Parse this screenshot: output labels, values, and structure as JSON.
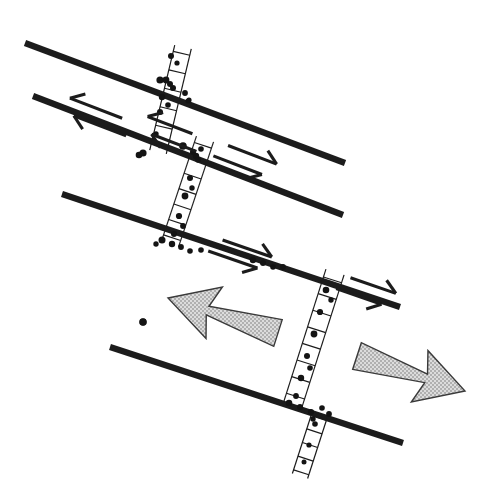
{
  "figure": {
    "domain_note": "structural geology line drawing",
    "canvas": {
      "width": 498,
      "height": 498,
      "background": "#ffffff"
    },
    "colors": {
      "line": "#1c1c1c",
      "clast": "#141414",
      "arrow_fill_light": "#d9d9d9",
      "arrow_outline": "#3a3a3a",
      "background": "#ffffff"
    }
  },
  "master_faults": [
    {
      "id": "fault-1",
      "label": "master fault 1",
      "x1": 25,
      "y1": 43,
      "x2": 345,
      "y2": 163,
      "stroke_width": 6.2
    },
    {
      "id": "fault-2",
      "label": "master fault 2",
      "x1": 33,
      "y1": 96,
      "x2": 343,
      "y2": 215,
      "stroke_width": 6.2
    },
    {
      "id": "fault-3",
      "label": "master fault 3",
      "x1": 62,
      "y1": 194,
      "x2": 400,
      "y2": 307,
      "stroke_width": 6.2
    },
    {
      "id": "fault-4",
      "label": "master fault 4",
      "x1": 110,
      "y1": 347,
      "x2": 403,
      "y2": 443,
      "stroke_width": 6.2
    }
  ],
  "dilational_bands": [
    {
      "id": "band-1",
      "label": "step-over band 1",
      "ax": 183,
      "ay": 47,
      "bx": 158,
      "by": 152,
      "half_width": 8.5,
      "rungs": 6,
      "clasts": [
        {
          "x": 171,
          "y": 56,
          "r": 3.0
        },
        {
          "x": 166,
          "y": 80,
          "r": 3.4
        },
        {
          "x": 162,
          "y": 97,
          "r": 3.2
        },
        {
          "x": 160,
          "y": 112,
          "r": 3.0
        },
        {
          "x": 156,
          "y": 134,
          "r": 2.7
        },
        {
          "x": 177,
          "y": 63,
          "r": 2.6
        },
        {
          "x": 173,
          "y": 88,
          "r": 3.0
        },
        {
          "x": 168,
          "y": 105,
          "r": 2.8
        }
      ]
    },
    {
      "id": "band-2",
      "label": "step-over band 2",
      "ax": 205,
      "ay": 139,
      "bx": 170,
      "by": 244,
      "half_width": 9.0,
      "rungs": 7,
      "clasts": [
        {
          "x": 196,
          "y": 156,
          "r": 3.2
        },
        {
          "x": 190,
          "y": 178,
          "r": 3.0
        },
        {
          "x": 185,
          "y": 196,
          "r": 3.4
        },
        {
          "x": 179,
          "y": 216,
          "r": 3.1
        },
        {
          "x": 174,
          "y": 234,
          "r": 3.0
        },
        {
          "x": 201,
          "y": 149,
          "r": 2.8
        },
        {
          "x": 192,
          "y": 188,
          "r": 2.7
        },
        {
          "x": 183,
          "y": 226,
          "r": 2.9
        }
      ]
    },
    {
      "id": "band-3",
      "label": "step-over band 3",
      "ax": 335,
      "ay": 272,
      "bx": 293,
      "by": 404,
      "half_width": 9.5,
      "rungs": 8,
      "clasts": [
        {
          "x": 326,
          "y": 290,
          "r": 3.3
        },
        {
          "x": 320,
          "y": 312,
          "r": 3.1
        },
        {
          "x": 314,
          "y": 334,
          "r": 3.4
        },
        {
          "x": 307,
          "y": 356,
          "r": 3.0
        },
        {
          "x": 301,
          "y": 378,
          "r": 3.2
        },
        {
          "x": 296,
          "y": 396,
          "r": 2.9
        },
        {
          "x": 331,
          "y": 300,
          "r": 2.7
        },
        {
          "x": 310,
          "y": 368,
          "r": 2.8
        }
      ]
    },
    {
      "id": "band-4",
      "label": "step-over band 4 (lower tail)",
      "ax": 320,
      "ay": 414,
      "bx": 300,
      "by": 476,
      "half_width": 8.0,
      "rungs": 5,
      "clasts": [
        {
          "x": 315,
          "y": 424,
          "r": 2.8
        },
        {
          "x": 309,
          "y": 445,
          "r": 2.6
        },
        {
          "x": 304,
          "y": 462,
          "r": 2.5
        }
      ]
    }
  ],
  "fault_trace_clasts": [
    {
      "x": 160,
      "y": 80,
      "r": 3.6
    },
    {
      "x": 170,
      "y": 84,
      "r": 3.0
    },
    {
      "x": 185,
      "y": 93,
      "r": 2.9
    },
    {
      "x": 188,
      "y": 101,
      "r": 2.6
    },
    {
      "x": 139,
      "y": 155,
      "r": 3.3
    },
    {
      "x": 183,
      "y": 146,
      "r": 3.8
    },
    {
      "x": 193,
      "y": 152,
      "r": 3.0
    },
    {
      "x": 198,
      "y": 160,
      "r": 2.8
    },
    {
      "x": 162,
      "y": 240,
      "r": 3.5
    },
    {
      "x": 172,
      "y": 244,
      "r": 3.2
    },
    {
      "x": 181,
      "y": 247,
      "r": 2.9
    },
    {
      "x": 190,
      "y": 251,
      "r": 2.8
    },
    {
      "x": 201,
      "y": 250,
      "r": 2.8
    },
    {
      "x": 156,
      "y": 244,
      "r": 2.7
    },
    {
      "x": 253,
      "y": 260,
      "r": 3.2
    },
    {
      "x": 263,
      "y": 263,
      "r": 3.0
    },
    {
      "x": 273,
      "y": 267,
      "r": 2.8
    },
    {
      "x": 283,
      "y": 267,
      "r": 2.9
    },
    {
      "x": 289,
      "y": 403,
      "r": 3.3
    },
    {
      "x": 300,
      "y": 407,
      "r": 3.0
    },
    {
      "x": 311,
      "y": 412,
      "r": 3.1
    },
    {
      "x": 322,
      "y": 408,
      "r": 2.8
    },
    {
      "x": 329,
      "y": 414,
      "r": 2.9
    },
    {
      "x": 313,
      "y": 419,
      "r": 2.7
    },
    {
      "x": 143,
      "y": 322,
      "r": 3.4
    }
  ],
  "slip_indicators": [
    {
      "id": "slip-1",
      "label": "sinistral half-arrow pair on master fault 2",
      "sense": "sinistral",
      "direction": "left",
      "cx": 98,
      "cy": 117,
      "angle_deg": 21,
      "length": 56
    },
    {
      "id": "slip-2",
      "label": "dextral half-arrow pair on master fault 2",
      "sense": "dextral",
      "direction": "right",
      "cx": 245,
      "cy": 160,
      "angle_deg": 21,
      "length": 52
    },
    {
      "id": "slip-3",
      "label": "sinistral half-arrow pair at band-2 tip",
      "sense": "sinistral",
      "direction": "left",
      "cx": 172,
      "cy": 134,
      "angle_deg": 21,
      "length": 48
    },
    {
      "id": "slip-4",
      "label": "dextral half-arrow pair on master fault 3",
      "sense": "dextral",
      "direction": "right",
      "cx": 240,
      "cy": 254,
      "angle_deg": 19,
      "length": 52
    },
    {
      "id": "slip-5",
      "label": "dextral half-arrow pair east of band-3 on master fault 3",
      "sense": "dextral",
      "direction": "right",
      "cx": 366,
      "cy": 291,
      "angle_deg": 19,
      "length": 48
    }
  ],
  "bulk_arrows": [
    {
      "id": "bulk-arrow-left",
      "label": "bulk shear sense arrow (west-directed)",
      "direction": "left",
      "tail_x": 278,
      "tail_y": 333,
      "tip_x": 168,
      "tip_y": 298,
      "fill": "#d9d9d9"
    },
    {
      "id": "bulk-arrow-right",
      "label": "bulk shear sense arrow (east-directed)",
      "direction": "right",
      "tail_x": 357,
      "tail_y": 356,
      "tip_x": 465,
      "tip_y": 391,
      "fill": "#d9d9d9"
    }
  ],
  "isolated_clasts": [
    {
      "x": 143,
      "y": 153,
      "r": 3.6,
      "label": "isolated clast A"
    },
    {
      "x": 143,
      "y": 322,
      "r": 3.8,
      "label": "isolated clast B"
    },
    {
      "x": 189,
      "y": 100,
      "r": 2.6,
      "label": "isolated clast C"
    }
  ]
}
